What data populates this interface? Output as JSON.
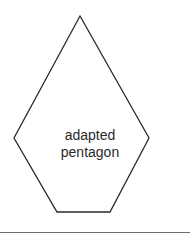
{
  "shape": {
    "name": "adapted pentagon",
    "label_lines": [
      "adapted",
      "pentagon"
    ],
    "stroke_color": "#2a2a2a",
    "vertices": [
      [
        80,
        16
      ],
      [
        149,
        138
      ],
      [
        110,
        212
      ],
      [
        57,
        212
      ],
      [
        14,
        138
      ]
    ]
  },
  "divider": {
    "color": "#6e6e6e"
  }
}
